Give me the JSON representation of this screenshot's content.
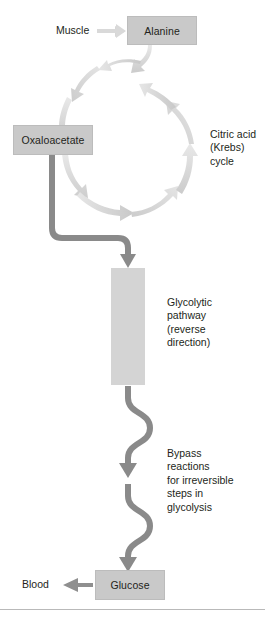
{
  "figure": {
    "width": 265,
    "height": 618,
    "background": "#ffffff"
  },
  "colors": {
    "box_fill": "#c9c9c9",
    "box_border": "#bcbcbc",
    "band_fill": "#d4d4d4",
    "text": "#231f20",
    "dark_arrow": "#8b8b8b",
    "mid_arrow": "#9a9a9a",
    "pale_arrow": "#dcdcdc",
    "pale_arrow_2": "#d0d0d0",
    "connector": "#8a8a8a",
    "rule": "#b9b9b9"
  },
  "nodes": [
    {
      "id": "alanine",
      "label": "Alanine",
      "x": 127,
      "y": 16,
      "w": 70,
      "h": 29
    },
    {
      "id": "oxaloacetate",
      "label": "Oxaloacetate",
      "x": 13,
      "y": 125,
      "w": 80,
      "h": 30
    },
    {
      "id": "glucose",
      "label": "Glucose",
      "x": 95,
      "y": 570,
      "w": 70,
      "h": 30
    }
  ],
  "labels": [
    {
      "id": "muscle",
      "text": "Muscle",
      "x": 56,
      "y": 24
    },
    {
      "id": "blood",
      "text": "Blood",
      "x": 22,
      "y": 578
    }
  ],
  "notes": [
    {
      "id": "krebs-cycle",
      "text": "Citric acid\n(Krebs)\ncycle",
      "x": 210,
      "y": 128
    },
    {
      "id": "glycolytic-pathway",
      "text": "Glycolytic\npathway\n(reverse\ndirection)",
      "x": 167,
      "y": 296
    },
    {
      "id": "bypass-reactions",
      "text": "Bypass\nreactions\nfor irreversible\nsteps in\nglycolysis",
      "x": 167,
      "y": 447
    }
  ],
  "bands": [
    {
      "id": "glycolysis-band",
      "x": 111,
      "y": 268,
      "w": 34,
      "h": 117
    }
  ],
  "arrows": {
    "muscle_to_alanine": {
      "from": "Muscle",
      "to": "Alanine",
      "direction": "right"
    },
    "glucose_to_blood": {
      "from": "Glucose",
      "to": "Blood",
      "direction": "left"
    },
    "cycle_direction": "counterclockwise",
    "glycolysis_arrow_count": 5,
    "bypass_curve_count": 2
  },
  "diagram_data": {
    "type": "diagram",
    "subject": "Glucose-alanine (Cahill) cycle — gluconeogenesis from alanine",
    "flow": [
      "Muscle → Alanine",
      "Alanine → Citric acid (Krebs) cycle",
      "Citric acid (Krebs) cycle → Oxaloacetate",
      "Oxaloacetate → Glycolytic pathway (reverse direction)",
      "Glycolytic pathway → Bypass reactions for irreversible steps in glycolysis",
      "Bypass reactions → Glucose",
      "Glucose → Blood"
    ]
  }
}
